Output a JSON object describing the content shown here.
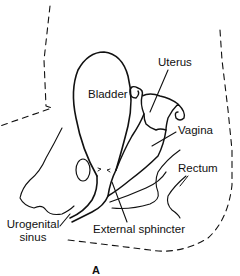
{
  "figure": {
    "panel_letter": "A",
    "labels": {
      "bladder": "Bladder",
      "uterus": "Uterus",
      "vagina": "Vagina",
      "rectum": "Rectum",
      "urogenital_sinus_line1": "Urogenital",
      "urogenital_sinus_line2": "sinus",
      "external_sphincter": "External sphincter"
    },
    "colors": {
      "stroke": "#111111",
      "background": "#ffffff"
    }
  }
}
